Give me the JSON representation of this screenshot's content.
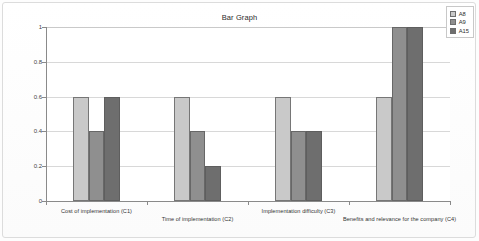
{
  "chart_data": {
    "type": "bar",
    "title": "Bar Graph",
    "xlabel": "",
    "ylabel": "",
    "ylim": [
      0,
      1
    ],
    "yticks": [
      "0",
      "0.2",
      "0.4",
      "0.6",
      "0.8",
      "1"
    ],
    "ytick_values": [
      0,
      0.2,
      0.4,
      0.6,
      0.8,
      1
    ],
    "grid": true,
    "legend_position": "top-right",
    "categories": [
      "Cost of implementation (C1)",
      "Time of implementation (C2)",
      "Implementation difficulty (C3)",
      "Benefits and relevance for the company (C4)"
    ],
    "series": [
      {
        "name": "A8",
        "color": "#c9c9c9",
        "values": [
          0.6,
          0.6,
          0.6,
          0.6
        ]
      },
      {
        "name": "A9",
        "color": "#8f8f8f",
        "values": [
          0.4,
          0.4,
          0.4,
          1.0
        ]
      },
      {
        "name": "A15",
        "color": "#6e6e6e",
        "values": [
          0.6,
          0.2,
          0.4,
          1.0
        ]
      }
    ]
  },
  "legend": {
    "items": [
      {
        "label": "A8"
      },
      {
        "label": "A9"
      },
      {
        "label": "A15"
      }
    ]
  }
}
